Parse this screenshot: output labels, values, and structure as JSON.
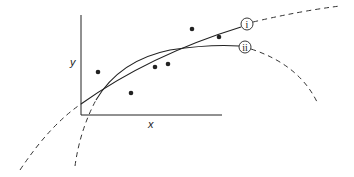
{
  "diagram": {
    "axis_labels": {
      "x": "x",
      "y": "y"
    },
    "curves": [
      {
        "id": "i",
        "label": "i",
        "style": "solid within data range, dashed extrapolation",
        "shape": "concave increasing, continues rising"
      },
      {
        "id": "ii",
        "label": "ii",
        "style": "solid within data range, dashed extrapolation",
        "shape": "concave, turns down beyond data"
      }
    ],
    "data_points": [
      {
        "x": 98,
        "y": 72
      },
      {
        "x": 131,
        "y": 93
      },
      {
        "x": 155,
        "y": 67
      },
      {
        "x": 168,
        "y": 64
      },
      {
        "x": 192,
        "y": 29
      },
      {
        "x": 219,
        "y": 37
      }
    ],
    "colors": {
      "ink": "#222222",
      "background": "#ffffff"
    }
  }
}
